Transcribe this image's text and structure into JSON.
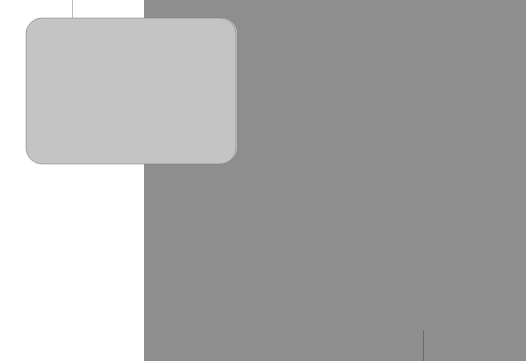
{
  "materials": [
    {
      "id": "thread",
      "label": ""
    },
    {
      "id": "scissors",
      "label": ""
    },
    {
      "id": "eyes",
      "label": "1/2\" eyes"
    },
    {
      "id": "stuffing",
      "label": ""
    },
    {
      "id": "embroidery-floss",
      "line1": "black",
      "line2": "red"
    },
    {
      "id": "felt",
      "label": "black"
    },
    {
      "id": "yarn",
      "weight": "4",
      "line1": "almond",
      "line2": "charcoal"
    },
    {
      "id": "hooks",
      "line1": "US size E",
      "line2": "US size 1"
    }
  ],
  "colors": {
    "panel": "#c2c2c2",
    "bubble": "#d8d8d8",
    "background": "#8e8e8e"
  }
}
